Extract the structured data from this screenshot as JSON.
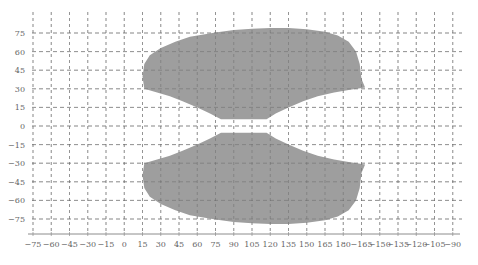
{
  "chart_data": {
    "type": "area",
    "title": "",
    "xlabel": "",
    "ylabel": "",
    "x_tick_labels": [
      "-75",
      "-60",
      "-45",
      "-30",
      "-15",
      "0",
      "15",
      "30",
      "45",
      "60",
      "75",
      "90",
      "105",
      "120",
      "135",
      "150",
      "165",
      "180",
      "-165",
      "-150",
      "-135",
      "-120",
      "-105",
      "-90"
    ],
    "y_tick_labels": [
      "75",
      "60",
      "45",
      "30",
      "15",
      "0",
      "-15",
      "-30",
      "-45",
      "-60",
      "-75"
    ],
    "y_tick_values": [
      75,
      60,
      45,
      30,
      15,
      0,
      -15,
      -30,
      -45,
      -60,
      -75
    ],
    "xlim_index": [
      0,
      23
    ],
    "ylim": [
      -90,
      90
    ],
    "grid": true,
    "grid_style": "dashed",
    "fill_color": "#9e9e9e",
    "grid_color": "#9a9a9a",
    "series": [
      {
        "name": "upper-region",
        "outline_lon_index_lat": [
          [
            6.1,
            30
          ],
          [
            6.0,
            40
          ],
          [
            6.1,
            50
          ],
          [
            6.4,
            57
          ],
          [
            7.0,
            63
          ],
          [
            7.8,
            68
          ],
          [
            8.6,
            72
          ],
          [
            10,
            75.5
          ],
          [
            11,
            77.5
          ],
          [
            12,
            78.5
          ],
          [
            13,
            79
          ],
          [
            14,
            79
          ],
          [
            15,
            78
          ],
          [
            16,
            76
          ],
          [
            16.7,
            73
          ],
          [
            17.3,
            68
          ],
          [
            17.7,
            60
          ],
          [
            17.9,
            50
          ],
          [
            18.0,
            38
          ],
          [
            18.2,
            31
          ],
          [
            17.3,
            29
          ],
          [
            16.5,
            27
          ],
          [
            15.6,
            24
          ],
          [
            14.8,
            20
          ],
          [
            14,
            15
          ],
          [
            13.3,
            10
          ],
          [
            12.8,
            5.5
          ],
          [
            10.3,
            5.5
          ],
          [
            9.7,
            10
          ],
          [
            9.0,
            15
          ],
          [
            8.2,
            20
          ],
          [
            7.5,
            24
          ],
          [
            6.8,
            27
          ],
          [
            6.1,
            30
          ]
        ]
      },
      {
        "name": "lower-region",
        "outline_lon_index_lat": [
          [
            6.1,
            -30
          ],
          [
            6.0,
            -40
          ],
          [
            6.1,
            -50
          ],
          [
            6.4,
            -57
          ],
          [
            7.0,
            -63
          ],
          [
            7.8,
            -68
          ],
          [
            8.6,
            -72
          ],
          [
            10,
            -75.5
          ],
          [
            11,
            -77.5
          ],
          [
            12,
            -78.5
          ],
          [
            13,
            -79
          ],
          [
            14,
            -79
          ],
          [
            15,
            -78
          ],
          [
            16,
            -76
          ],
          [
            16.7,
            -73
          ],
          [
            17.3,
            -68
          ],
          [
            17.7,
            -60
          ],
          [
            17.9,
            -50
          ],
          [
            18.0,
            -38
          ],
          [
            18.2,
            -31
          ],
          [
            17.3,
            -29
          ],
          [
            16.5,
            -27
          ],
          [
            15.6,
            -24
          ],
          [
            14.8,
            -20
          ],
          [
            14,
            -15
          ],
          [
            13.3,
            -10
          ],
          [
            12.8,
            -5.5
          ],
          [
            10.3,
            -5.5
          ],
          [
            9.7,
            -10
          ],
          [
            9.0,
            -15
          ],
          [
            8.2,
            -20
          ],
          [
            7.5,
            -24
          ],
          [
            6.8,
            -27
          ],
          [
            6.1,
            -30
          ]
        ]
      }
    ]
  }
}
